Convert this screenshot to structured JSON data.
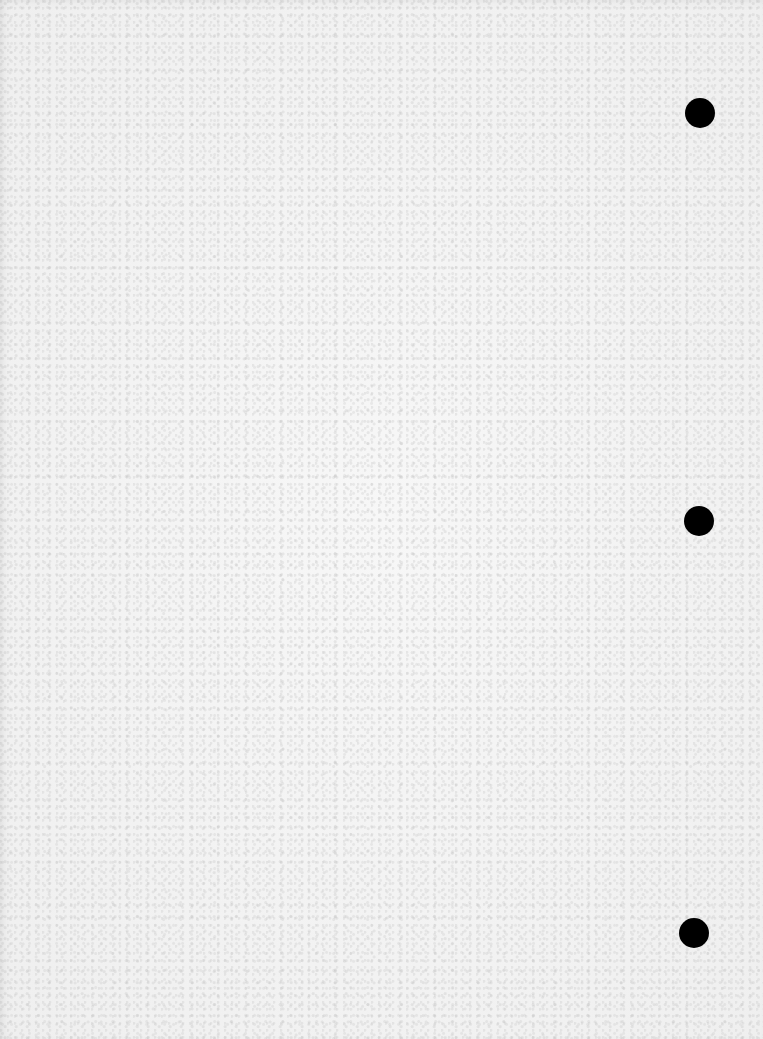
{
  "document": {
    "type": "blank scanned page",
    "content_text": "",
    "background_color": "#f4f4f4",
    "punch_holes": [
      {
        "name": "punch-hole-top",
        "cx": 700,
        "cy": 113,
        "r": 15,
        "color": "#000000"
      },
      {
        "name": "punch-hole-middle",
        "cx": 699,
        "cy": 521,
        "r": 15,
        "color": "#000000"
      },
      {
        "name": "punch-hole-bottom",
        "cx": 694,
        "cy": 933,
        "r": 15,
        "color": "#000000"
      }
    ]
  }
}
